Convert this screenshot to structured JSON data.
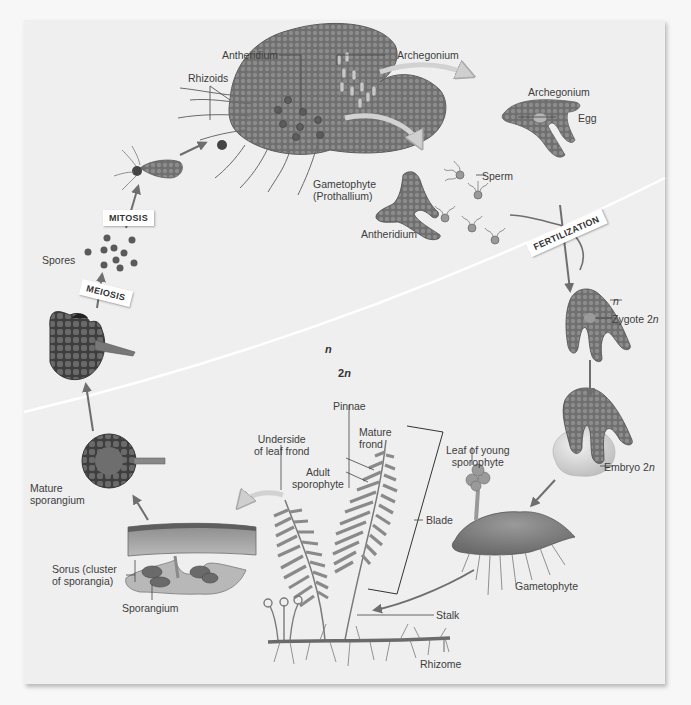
{
  "diagram": {
    "colors": {
      "background": "#f7f7f7",
      "panel": "#efefef",
      "tissue": "#7a7a7a",
      "tissue_dark": "#4a4a4a",
      "arrow": "#6e6e6e",
      "divider": "#ffffff"
    },
    "process_tags": {
      "mitosis": "MITOSIS",
      "meiosis": "MEIOSIS",
      "fertilization": "FERTILIZATION"
    },
    "ploidy_regions": {
      "haploid": "n",
      "diploid_num": "2",
      "diploid_var": "n"
    },
    "labels": {
      "antheridium_top": "Antheridium",
      "archegonium_top": "Archegonium",
      "rhizoids": "Rhizoids",
      "gametophyte_prothallium_1": "Gametophyte",
      "gametophyte_prothallium_2": "(Prothallium)",
      "archegonium_right": "Archegonium",
      "egg": "Egg",
      "sperm": "Sperm",
      "antheridium_mid": "Antheridium",
      "spores": "Spores",
      "zygote_n": "n",
      "zygote_text": "Zygote 2",
      "zygote_var": "n",
      "embryo_text": "Embryo 2",
      "embryo_var": "n",
      "pinnae": "Pinnae",
      "underside_1": "Underside",
      "underside_2": "of leaf frond",
      "mature_frond_1": "Mature",
      "mature_frond_2": "frond",
      "adult_sporophyte_1": "Adult",
      "adult_sporophyte_2": "sporophyte",
      "leaf_young_1": "Leaf of young",
      "leaf_young_2": "sporophyte",
      "blade": "Blade",
      "mature_sporangium_1": "Mature",
      "mature_sporangium_2": "sporangium",
      "sorus_1": "Sorus (cluster",
      "sorus_2": "of sporangia)",
      "sporangium": "Sporangium",
      "gametophyte_bottom": "Gametophyte",
      "stalk": "Stalk",
      "rhizome": "Rhizome"
    }
  }
}
